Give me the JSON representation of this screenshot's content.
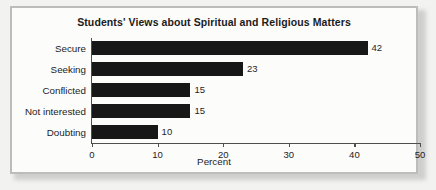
{
  "figure": {
    "frame_color": "#bdbdbb",
    "page_background": "#f3f3f1",
    "plot_background": "#fdfdfc"
  },
  "chart_data": {
    "type": "bar",
    "orientation": "horizontal",
    "title": "Students' Views about Spiritual and Religious Matters",
    "categories": [
      "Secure",
      "Seeking",
      "Conflicted",
      "Not interested",
      "Doubting"
    ],
    "values": [
      42,
      23,
      15,
      15,
      10
    ],
    "data_labels": [
      "42",
      "23",
      "15",
      "15",
      "10"
    ],
    "xlabel": "Percent",
    "ylabel": "",
    "xlim": [
      0,
      50
    ],
    "xticks": [
      0,
      10,
      20,
      30,
      40,
      50
    ],
    "xtick_labels": [
      "0",
      "10",
      "20",
      "30",
      "40",
      "50"
    ],
    "grid": false,
    "legend": false,
    "bar_color": "#171717",
    "axis_color": "#4f4f4f"
  }
}
